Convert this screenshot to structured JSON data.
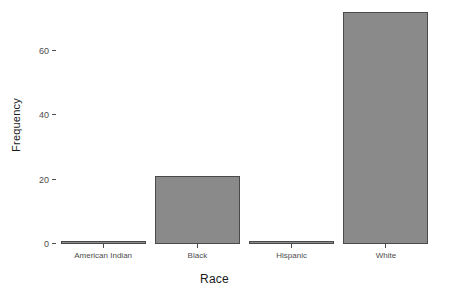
{
  "chart_data": {
    "type": "bar",
    "title": "",
    "subtitle": "",
    "xlabel": "Race",
    "ylabel": "Frequency",
    "categories": [
      "American Indian",
      "Black",
      "Hispanic",
      "White"
    ],
    "values": [
      1,
      21,
      1,
      72
    ],
    "ylim": [
      0,
      74
    ],
    "y_ticks": [
      0,
      20,
      40,
      60
    ],
    "y_tick_labels": [
      "0",
      "20",
      "40",
      "60"
    ],
    "grid": false,
    "legend": "none",
    "series": [
      {
        "name": "Frequency",
        "values": [
          1,
          21,
          1,
          72
        ]
      }
    ],
    "colors": {
      "bar_fill": "#8a8a8a",
      "bar_border": "#4a4a4a",
      "background": "#ffffff",
      "axis_text": "#4d4d4d",
      "axis_title": "#1a1a1a"
    }
  }
}
